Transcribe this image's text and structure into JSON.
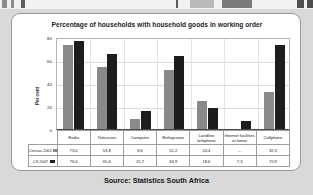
{
  "source_note": "Source: Statistics South Africa",
  "legend_swatch_names": [
    "census-2001-swatch",
    "cs-2007-swatch"
  ],
  "chart_data": {
    "type": "bar",
    "title": "Percentage of households with household goods in working order",
    "xlabel": "",
    "ylabel": "Per cent",
    "ylim": [
      0,
      80
    ],
    "yticks": [
      0,
      20,
      40,
      60,
      80
    ],
    "grid": true,
    "legend_position": "table-row-labels",
    "categories": [
      "Radio",
      "Television",
      "Computer",
      "Refrigerator",
      "Landline telephone",
      "Internet facilities at home",
      "Cellphone"
    ],
    "series": [
      {
        "name": "Census 2001",
        "color": "#8a8a8a",
        "values": [
          73.0,
          53.8,
          8.6,
          51.2,
          24.4,
          null,
          32.3
        ],
        "labels": [
          "73,0",
          "53,8",
          "8,6",
          "51,2",
          "24,4",
          "–",
          "32,3"
        ]
      },
      {
        "name": "CS 2007",
        "color": "#1d1d1d",
        "values": [
          76.6,
          65.6,
          15.7,
          63.9,
          18.6,
          7.3,
          72.9
        ],
        "labels": [
          "76,6",
          "65,6",
          "15,7",
          "63,9",
          "18,6",
          "7,3",
          "72,9"
        ]
      }
    ]
  }
}
